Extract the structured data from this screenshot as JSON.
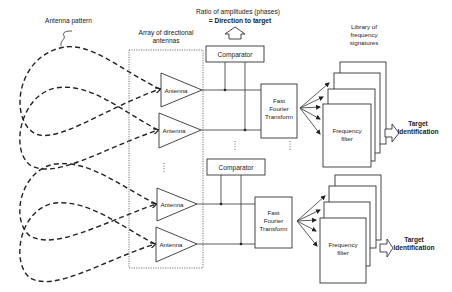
{
  "labels": {
    "antenna_pattern": "Antenna pattern",
    "array_title_line1": "Array of directional",
    "array_title_line2": "antennas",
    "ratio_line1": "Ratio of amplitudes (phases)",
    "ratio_line2": "= Direction to target",
    "library_line1": "Library of",
    "library_line2": "frequency",
    "library_line3": "signatures"
  },
  "antennas": [
    {
      "label": "Antenna"
    },
    {
      "label": "Antenna"
    },
    {
      "label": "Antenna"
    },
    {
      "label": "Antenna"
    }
  ],
  "channels": [
    {
      "comparator": "Comparator",
      "fft_line1": "Fast",
      "fft_line2": "Fourier",
      "fft_line3": "Transform",
      "filter_line1": "Frequency",
      "filter_line2": "filter",
      "output_line1": "Target",
      "output_line2": "Identification"
    },
    {
      "comparator": "Comparator",
      "fft_line1": "Fast",
      "fft_line2": "Fourier",
      "fft_line3": "Transform",
      "filter_line1": "Frequency",
      "filter_line2": "filter",
      "output_line1": "Target",
      "output_line2": "Identification"
    }
  ]
}
